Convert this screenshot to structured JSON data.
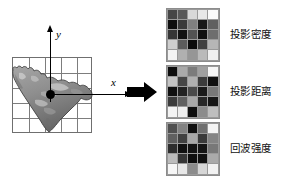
{
  "figure": {
    "background_color": "#ffffff",
    "axes": {
      "x_label": "x",
      "y_label": "y",
      "origin_marker": "filled-dot"
    },
    "source_view": {
      "name": "point-cloud-projection",
      "grid_rows": 5,
      "grid_columns": 5,
      "grid_line_color": "#7d7d7d",
      "cloud_fill": "#9b9b9b",
      "cloud_stroke": "#4a4a4a"
    },
    "flow_arrow": {
      "direction": "right",
      "color": "#000000"
    }
  },
  "feature_maps": [
    {
      "id": "projection-density",
      "label": "投影密度",
      "rows": 5,
      "columns": 5,
      "values": [
        [
          70,
          88,
          216,
          232,
          250
        ],
        [
          14,
          58,
          128,
          24,
          96
        ],
        [
          54,
          18,
          82,
          16,
          110
        ],
        [
          206,
          92,
          12,
          64,
          182
        ],
        [
          244,
          176,
          150,
          186,
          240
        ]
      ]
    },
    {
      "id": "projection-distance",
      "label": "投影距离",
      "rows": 5,
      "columns": 5,
      "values": [
        [
          14,
          170,
          124,
          160,
          246
        ],
        [
          196,
          70,
          176,
          60,
          16
        ],
        [
          16,
          34,
          74,
          26,
          120
        ],
        [
          60,
          96,
          168,
          40,
          22
        ],
        [
          244,
          238,
          14,
          140,
          190
        ]
      ]
    },
    {
      "id": "echo-intensity",
      "label": "回波强度",
      "rows": 5,
      "columns": 5,
      "values": [
        [
          80,
          130,
          16,
          112,
          244
        ],
        [
          96,
          64,
          168,
          58,
          132
        ],
        [
          46,
          16,
          18,
          20,
          120
        ],
        [
          188,
          54,
          14,
          16,
          170
        ],
        [
          246,
          232,
          140,
          214,
          242
        ]
      ]
    }
  ],
  "chart_data": {
    "type": "heatmap",
    "title": "",
    "xlabel": "x",
    "ylabel": "y",
    "grid": true,
    "legend_position": "right",
    "colormap": "grayscale",
    "value_range": [
      0,
      255
    ],
    "panels": [
      {
        "name": "投影密度",
        "values": [
          [
            70,
            88,
            216,
            232,
            250
          ],
          [
            14,
            58,
            128,
            24,
            96
          ],
          [
            54,
            18,
            82,
            16,
            110
          ],
          [
            206,
            92,
            12,
            64,
            182
          ],
          [
            244,
            176,
            150,
            186,
            240
          ]
        ]
      },
      {
        "name": "投影距离",
        "values": [
          [
            14,
            170,
            124,
            160,
            246
          ],
          [
            196,
            70,
            176,
            60,
            16
          ],
          [
            16,
            34,
            74,
            26,
            120
          ],
          [
            60,
            96,
            168,
            40,
            22
          ],
          [
            244,
            238,
            14,
            140,
            190
          ]
        ]
      },
      {
        "name": "回波强度",
        "values": [
          [
            80,
            130,
            16,
            112,
            244
          ],
          [
            96,
            64,
            168,
            58,
            132
          ],
          [
            46,
            16,
            18,
            20,
            120
          ],
          [
            188,
            54,
            14,
            16,
            170
          ],
          [
            246,
            232,
            140,
            214,
            242
          ]
        ]
      }
    ]
  }
}
